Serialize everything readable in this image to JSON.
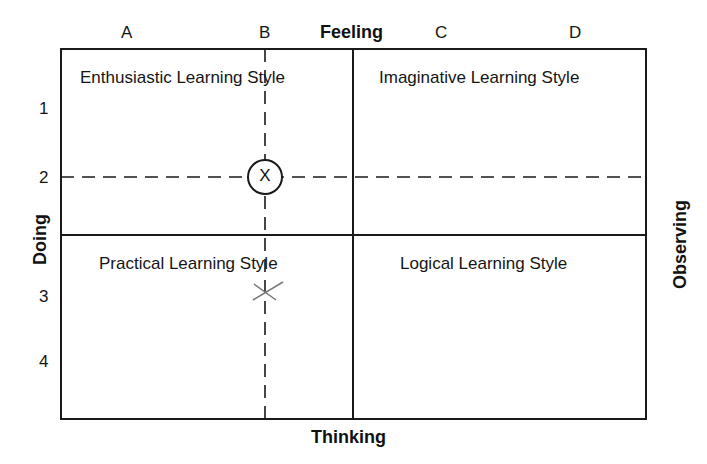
{
  "axes": {
    "top": "Feeling",
    "bottom": "Thinking",
    "left": "Doing",
    "right": "Observing"
  },
  "columns": [
    "A",
    "B",
    "C",
    "D"
  ],
  "rows": [
    "1",
    "2",
    "3",
    "4"
  ],
  "quadrants": {
    "top_left": "Enthusiastic Learning Style",
    "top_right": "Imaginative Learning Style",
    "bottom_left": "Practical Learning Style",
    "bottom_right": "Logical Learning Style"
  },
  "markers": {
    "circled": {
      "label": "X",
      "column": "B",
      "row": "2"
    },
    "pencil": {
      "label": "x",
      "column": "B",
      "row": "3"
    }
  },
  "colors": {
    "line": "#1a1a1a",
    "pencil": "#777777"
  }
}
